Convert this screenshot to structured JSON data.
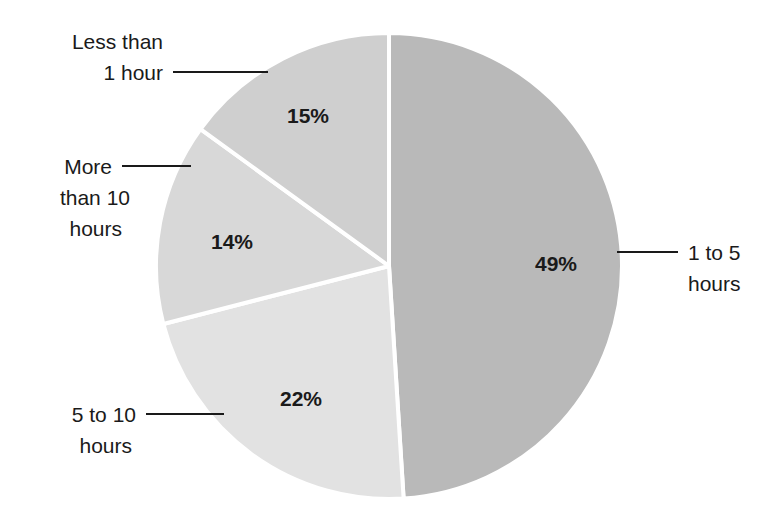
{
  "chart_data": {
    "type": "pie",
    "title": "",
    "subtitle": "",
    "xlabel": "",
    "ylabel": "",
    "legend_position": "callout-labels",
    "grid": false,
    "unit": "%",
    "start_angle_deg": 0,
    "direction": "clockwise",
    "categories": [
      "1 to 5 hours",
      "5 to 10 hours",
      "More than 10 hours",
      "Less than 1 hour"
    ],
    "values": [
      49,
      22,
      14,
      15
    ],
    "slices": [
      {
        "label": "1 to 5 hours",
        "label_line1": "1 to 5",
        "label_line2": "hours",
        "value": 49,
        "value_text": "49%",
        "color": "#b9b9b9"
      },
      {
        "label": "5 to 10 hours",
        "label_line1": "5 to 10",
        "label_line2": "hours",
        "value": 22,
        "value_text": "22%",
        "color": "#e2e2e2"
      },
      {
        "label": "More than 10 hours",
        "label_line1": "More",
        "label_line2": "than 10",
        "label_line3": "hours",
        "value": 14,
        "value_text": "14%",
        "color": "#d8d8d8"
      },
      {
        "label": "Less than 1 hour",
        "label_line1": "Less than",
        "label_line2": "1 hour",
        "value": 15,
        "value_text": "15%",
        "color": "#cfcfcf"
      }
    ],
    "colors": {
      "background": "#ffffff",
      "slice_border": "#ffffff",
      "text": "#1a1a1a",
      "leader_line": "#1a1a1a"
    }
  }
}
